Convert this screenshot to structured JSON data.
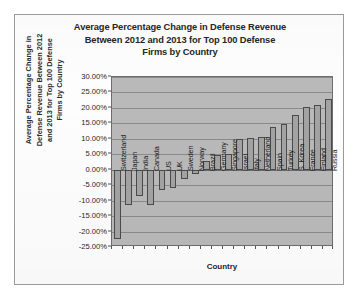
{
  "chart_data": {
    "type": "bar",
    "title": "Average Percentage Change in Defense Revenue Between 2012 and 2013 for Top 100 Defense Firms by Country",
    "title_lines": [
      "Average Percentage Change in Defense Revenue",
      "Between 2012 and 2013 for Top 100 Defense",
      "Firms by Country"
    ],
    "xlabel": "Country",
    "ylabel": "Average Percentage Change in Defense Revenue Between 2012 and 2013 for Top 100 Defense Firms by Country",
    "ylabel_lines": [
      "Average Percentage Change in",
      "Defense Revenue Between 2012",
      "and 2013 for Top 100 Defense",
      "Firms by Country"
    ],
    "ylim": [
      -25,
      30
    ],
    "ytick_labels": [
      "30.00%",
      "25.00%",
      "20.00%",
      "15.00%",
      "10.00%",
      "5.00%",
      "0.00%",
      "-5.00%",
      "-10.00%",
      "-15.00%",
      "-20.00%",
      "-25.00%"
    ],
    "ytick_values": [
      30,
      25,
      20,
      15,
      10,
      5,
      0,
      -5,
      -10,
      -15,
      -20,
      -25
    ],
    "grid": true,
    "legend": "none",
    "bar_fill": "#a3a3a3",
    "bar_edge": "#4a4a4a",
    "plot_background": "#b9b9b9",
    "categories": [
      "Switzerland",
      "Japan",
      "India",
      "Canada",
      "US",
      "UK",
      "Sweden",
      "Norway",
      "Brazil",
      "Germany",
      "Singapore",
      "Israel",
      "Italy",
      "Netherland",
      "Spain",
      "Turkey",
      "S. Korea",
      "France",
      "Finland",
      "Russia"
    ],
    "values": [
      -22.5,
      -11.5,
      -8.5,
      -11.5,
      -6.5,
      -6.0,
      -3.0,
      -1.5,
      2.9,
      4.9,
      5.2,
      9.8,
      10.3,
      10.7,
      13.9,
      14.7,
      17.8,
      20.3,
      21.0,
      23.0
    ]
  }
}
